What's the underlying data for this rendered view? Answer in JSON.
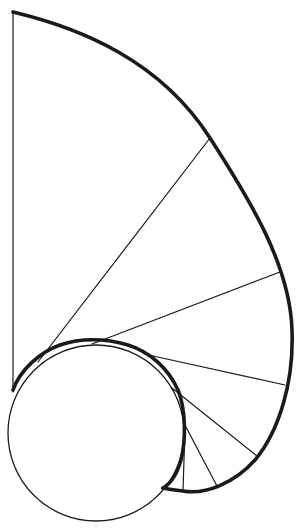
{
  "diagram": {
    "title": "",
    "stroke_color": "#1a1a1a",
    "background_color": "#ffffff",
    "elements": [
      {
        "name": "base-circle",
        "kind": "circle"
      },
      {
        "name": "involute-outer-curve",
        "kind": "curve"
      },
      {
        "name": "involute-inner-wrap",
        "kind": "curve"
      },
      {
        "name": "vertical-axis-line",
        "kind": "line"
      },
      {
        "name": "tangent-line",
        "kind": "line",
        "count": 6
      }
    ]
  }
}
